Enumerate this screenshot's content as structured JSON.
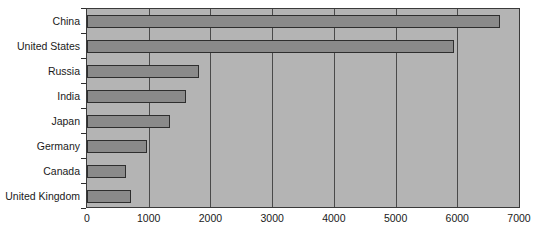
{
  "chart_data": {
    "type": "bar",
    "orientation": "horizontal",
    "title": "",
    "xlabel": "",
    "ylabel": "",
    "categories": [
      "China",
      "United States",
      "Russia",
      "India",
      "Japan",
      "Germany",
      "Canada",
      "United Kingdom"
    ],
    "values": [
      6700,
      5950,
      1820,
      1600,
      1340,
      970,
      630,
      720
    ],
    "xticks": [
      "0",
      "1000",
      "2000",
      "3000",
      "4000",
      "5000",
      "6000",
      "7000"
    ],
    "xtick_values": [
      0,
      1000,
      2000,
      3000,
      4000,
      5000,
      6000,
      7000
    ],
    "xlim": [
      0,
      7000
    ],
    "grid": "vertical",
    "legend": "none",
    "colors": {
      "plot_background": "#b4b4b4",
      "bar_fill": "#8a8a8a",
      "bar_edge": "#2e2e2e",
      "gridline": "#4a4a4a",
      "axis": "#3a3a3a",
      "text": "#1a1a1a",
      "page_background": "#ffffff"
    }
  }
}
